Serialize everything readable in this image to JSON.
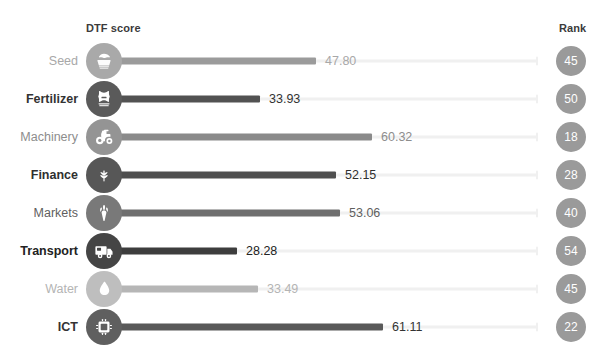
{
  "header": {
    "score_column_label": "DTF score",
    "rank_column_label": "Rank"
  },
  "colors": {
    "background": "#ffffff",
    "track": "#f0f0f0",
    "rank_bubble": "#9a9a9a",
    "rank_text": "#ffffff",
    "dark": "#4a4a4a",
    "mid": "#6d6d6d",
    "light": "#9b9b9b",
    "lightest": "#b6b6b6",
    "label_dark": "#333333",
    "label_light": "#a8a8a8"
  },
  "chart_data": {
    "type": "bar",
    "title": "",
    "xlabel": "DTF score",
    "ylabel": "",
    "xlim": [
      0,
      100
    ],
    "grid": false,
    "legend": "none",
    "orientation": "horizontal",
    "style": "lollipop",
    "categories": [
      "Seed",
      "Fertilizer",
      "Machinery",
      "Finance",
      "Markets",
      "Transport",
      "Water",
      "ICT"
    ],
    "values": [
      47.8,
      33.93,
      60.32,
      52.15,
      53.06,
      28.28,
      33.49,
      61.11
    ],
    "value_labels": [
      "47.80",
      "33.93",
      "60.32",
      "52.15",
      "53.06",
      "28.28",
      "33.49",
      "61.11"
    ],
    "ranks": [
      45,
      50,
      18,
      28,
      40,
      54,
      45,
      22
    ],
    "rank_labels": [
      "45",
      "50",
      "18",
      "28",
      "40",
      "54",
      "45",
      "22"
    ]
  },
  "rows": [
    {
      "category": "Seed",
      "value_label": "47.80",
      "rank_label": "45",
      "icon": "seed-icon",
      "bar_color": "#9b9b9b",
      "circle_color": "#a9a9a9",
      "label_color": "#a8a8a8",
      "value_color": "#a8a8a8",
      "bar_width_px": 212
    },
    {
      "category": "Fertilizer",
      "value_label": "33.93",
      "rank_label": "50",
      "icon": "fertilizer-bag-icon",
      "bar_color": "#525252",
      "circle_color": "#5a5a5a",
      "label_color": "#333333",
      "value_color": "#333333",
      "bar_width_px": 156
    },
    {
      "category": "Machinery",
      "value_label": "60.32",
      "rank_label": "18",
      "icon": "tractor-icon",
      "bar_color": "#8a8a8a",
      "circle_color": "#949494",
      "label_color": "#8d8d8d",
      "value_color": "#8d8d8d",
      "bar_width_px": 268
    },
    {
      "category": "Finance",
      "value_label": "52.15",
      "rank_label": "28",
      "icon": "plant-coin-icon",
      "bar_color": "#4f4f4f",
      "circle_color": "#575757",
      "label_color": "#2f2f2f",
      "value_color": "#2f2f2f",
      "bar_width_px": 232
    },
    {
      "category": "Markets",
      "value_label": "53.06",
      "rank_label": "40",
      "icon": "carrot-icon",
      "bar_color": "#6f6f6f",
      "circle_color": "#797979",
      "label_color": "#5f5f5f",
      "value_color": "#5f5f5f",
      "bar_width_px": 236
    },
    {
      "category": "Transport",
      "value_label": "28.28",
      "rank_label": "54",
      "icon": "truck-icon",
      "bar_color": "#3d3d3d",
      "circle_color": "#454545",
      "label_color": "#222222",
      "value_color": "#222222",
      "bar_width_px": 133
    },
    {
      "category": "Water",
      "value_label": "33.49",
      "rank_label": "45",
      "icon": "water-drop-icon",
      "bar_color": "#b6b6b6",
      "circle_color": "#bebebe",
      "label_color": "#b4b4b4",
      "value_color": "#b4b4b4",
      "bar_width_px": 154
    },
    {
      "category": "ICT",
      "value_label": "61.11",
      "rank_label": "22",
      "icon": "computer-chip-icon",
      "bar_color": "#595959",
      "circle_color": "#5f5f5f",
      "label_color": "#333333",
      "value_color": "#333333",
      "bar_width_px": 279
    }
  ]
}
